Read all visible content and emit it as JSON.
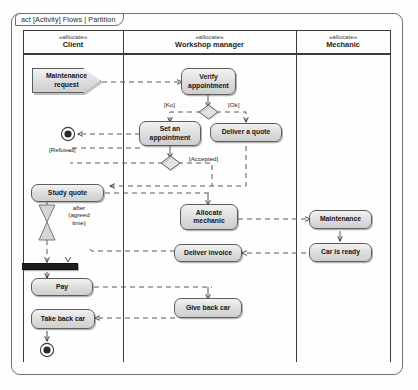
{
  "diagram": {
    "tab_label": "act [Activity] Flows | Partition",
    "kind": "uml-activity-diagram",
    "colors": {
      "node_fill_light": "#f2f2f2",
      "node_fill_dark": "#cfcfcf",
      "node_border": "#5d5d5d",
      "lane_border": "#3b3b3b",
      "frame_border": "#6f6f6f",
      "bar_fill": "#1d1d1d",
      "text": "#161616",
      "page_background": "#fdfdfd"
    }
  },
  "lanes": [
    {
      "stereotype": "«allocate»",
      "name": "Client"
    },
    {
      "stereotype": "«allocate»",
      "name": "Workshop manager"
    },
    {
      "stereotype": "«allocate»",
      "name": "Mechanic"
    }
  ],
  "nodes": {
    "maintenance_request": {
      "label": "Maintenance\nrequest",
      "line1": "Maintenance",
      "line2": "request",
      "type": "send-signal",
      "lane": "Client"
    },
    "verify_appointment": {
      "label": "Verify\nappointment",
      "line1": "Verify",
      "line2": "appointment",
      "type": "action",
      "lane": "Workshop manager"
    },
    "set_an_appointment": {
      "label": "Set an\nappointment",
      "line1": "Set an",
      "line2": "appointment",
      "type": "action",
      "lane": "Workshop manager"
    },
    "deliver_a_quote": {
      "label": "Deliver a quote",
      "type": "action",
      "lane": "Workshop manager"
    },
    "study_quote": {
      "label": "Study quote",
      "type": "action",
      "lane": "Client"
    },
    "allocate_mechanic": {
      "label": "Allocate\nmechanic",
      "line1": "Allocate",
      "line2": "mechanic",
      "type": "action",
      "lane": "Workshop manager"
    },
    "maintenance": {
      "label": "Maintenance",
      "type": "action",
      "lane": "Mechanic"
    },
    "car_is_ready": {
      "label": "Car is ready",
      "type": "action",
      "lane": "Mechanic"
    },
    "deliver_invoice": {
      "label": "Deliver invoice",
      "type": "action",
      "lane": "Workshop manager"
    },
    "pay": {
      "label": "Pay",
      "type": "action",
      "lane": "Client"
    },
    "give_back_car": {
      "label": "Give back car",
      "type": "action",
      "lane": "Workshop manager"
    },
    "take_back_car": {
      "label": "Take back car",
      "type": "action",
      "lane": "Client"
    },
    "decision_ok_ko": {
      "label": "",
      "type": "decision",
      "lane": "Workshop manager"
    },
    "merge_accepted": {
      "label": "",
      "type": "merge",
      "lane": "Workshop manager"
    },
    "final_refused": {
      "label": "",
      "type": "activity-final",
      "lane": "Client"
    },
    "final_end": {
      "label": "",
      "type": "activity-final",
      "lane": "Client"
    },
    "join_bar": {
      "label": "",
      "type": "join",
      "lane": "Client"
    },
    "time_event": {
      "label": "after\n(agreed\ntime)",
      "type": "time-event",
      "lane": "Client"
    }
  },
  "guards": {
    "ko": "[Ko]",
    "ok": "[Ok]",
    "refused": "[Refused]",
    "accepted": "[Accepted]"
  },
  "time_event_label": {
    "line1": "after",
    "line2": "(agreed",
    "line3": "time)"
  }
}
